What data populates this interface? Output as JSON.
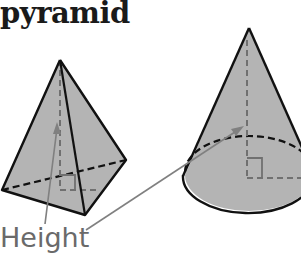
{
  "title": "pyramid",
  "label": "Height",
  "figures": [
    {
      "name": "pyramid",
      "fill": "#b4b4b4"
    },
    {
      "name": "cone",
      "fill": "#b4b4b4"
    }
  ],
  "colors": {
    "edge": "#111111",
    "dashed_height": "#707070",
    "arrow": "#808080",
    "text": "#6a6a6a"
  }
}
